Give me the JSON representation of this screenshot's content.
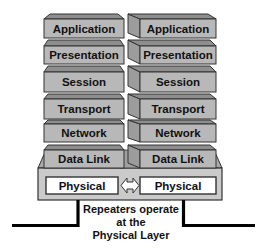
{
  "diagram": {
    "left_stack": {
      "layers": [
        "Application",
        "Presentation",
        "Session",
        "Transport",
        "Network",
        "Data Link",
        "Physical"
      ]
    },
    "right_stack": {
      "layers": [
        "Application",
        "Presentation",
        "Session",
        "Transport",
        "Network",
        "Data Link",
        "Physical"
      ]
    },
    "connector": "double-arrow-icon",
    "caption": {
      "line1": "Repeaters operate",
      "line2": "at the",
      "line3": "Physical Layer"
    },
    "colors": {
      "layer_face": "#b8b8b8",
      "layer_bevel": "#8e8e8e",
      "base_panel": "#cacaca",
      "physical_box": "#ffffff",
      "cable": "#000000",
      "outline": "#333333"
    }
  }
}
